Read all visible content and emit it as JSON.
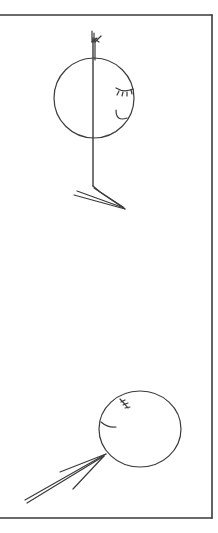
{
  "drawing": {
    "stroke_color": "#3a3a3a",
    "background": "#ffffff",
    "frame": {
      "top_y": 15,
      "right_x": 212,
      "bottom_y": 518,
      "left_x": 0
    },
    "figure_top": {
      "head": {
        "cx": 94,
        "cy": 98,
        "r": 40
      },
      "pole": {
        "x": 93,
        "y1": 32,
        "y2": 186
      },
      "eye": "closed-eye-with-lashes",
      "mouth": "smile-arc",
      "legs": "splayed-lines"
    },
    "figure_bottom": {
      "head": {
        "cx": 140,
        "cy": 429,
        "rx": 41,
        "ry": 38
      },
      "eye": "closed-eye-with-lashes",
      "mouth": "smile-arc",
      "legs": "splayed-lines"
    }
  }
}
